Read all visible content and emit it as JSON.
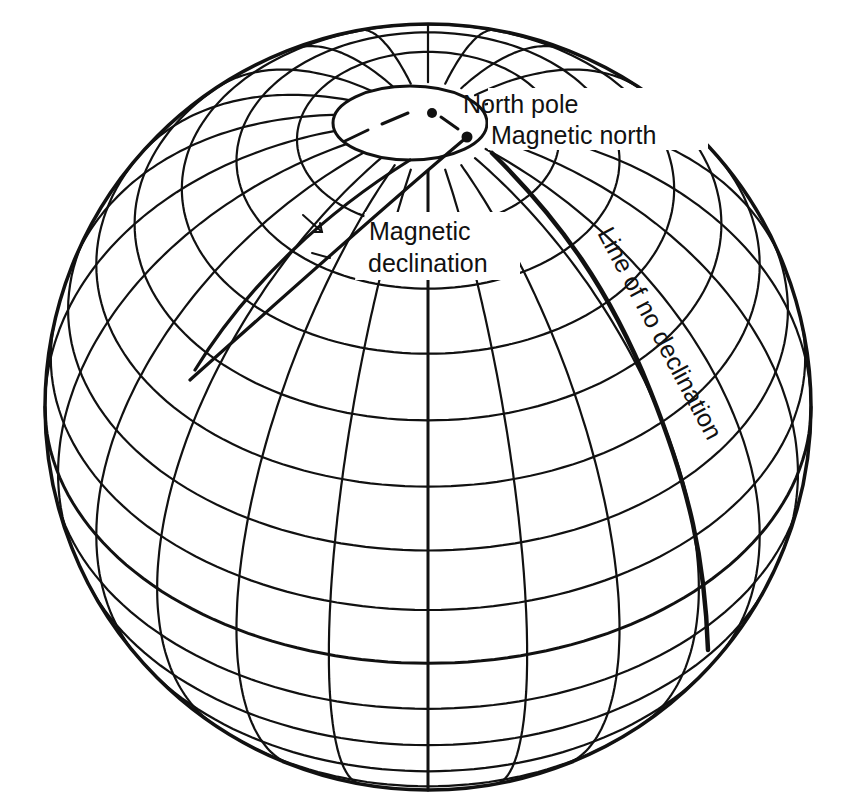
{
  "figure": {
    "type": "globe-diagram",
    "labels": {
      "north_pole": "North pole",
      "magnetic_north": "Magnetic north",
      "magnetic_declination_line1": "Magnetic",
      "magnetic_declination_line2": "declination",
      "line_of_no_declination": "Line of no declination"
    },
    "colors": {
      "ink": "#111111",
      "background": "#ffffff"
    }
  },
  "globe": {
    "center_x": 428,
    "center_y": 407,
    "radius": 383,
    "view_latitude_deg": 42,
    "parallel_step_deg": 10,
    "meridian_step_deg": 15,
    "polar_cap_latitude_deg": 80,
    "north_pole_point": [
      432,
      113
    ],
    "magnetic_north_point": [
      467,
      137
    ]
  },
  "annotations": {
    "no_declination_line": "heavy isogonic line passing through magnetic north and curving down the right side",
    "declination_line": "heavy isogonic line on the left with arrow indicating declination angle"
  }
}
